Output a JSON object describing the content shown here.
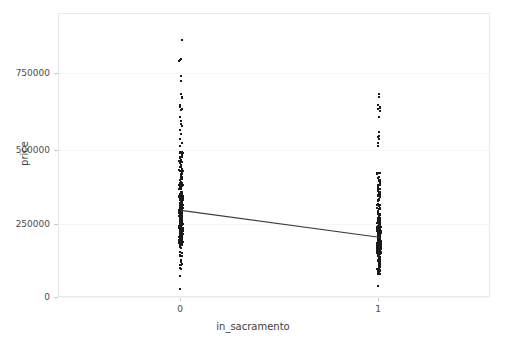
{
  "chart": {
    "title": "",
    "xlabel": "in_sacramento",
    "ylabel": "price",
    "xticks": [
      "0",
      "1"
    ],
    "yticks": [
      "0",
      "250000",
      "500000",
      "750000"
    ],
    "axis_color": "#e8e8e8",
    "point_color": "#1a1a1a",
    "line_color": "#3c3c3c"
  },
  "chart_data": {
    "type": "scatter",
    "title": "",
    "xlabel": "in_sacramento",
    "ylabel": "price",
    "xlim": [
      -0.5,
      1.5
    ],
    "ylim": [
      0,
      900000
    ],
    "xticks": [
      0,
      1
    ],
    "xtick_labels": [
      "0",
      "1"
    ],
    "yticks": [
      0,
      250000,
      500000,
      750000
    ],
    "ytick_labels": [
      "0",
      "250000",
      "500000",
      "750000"
    ],
    "grid": true,
    "legend": null,
    "categories": [
      "0",
      "1"
    ],
    "series": [
      {
        "name": "in_sacramento = 0",
        "x": 0,
        "n_points": 420,
        "min": 30000,
        "max": 884790,
        "mean": 300000,
        "median": 243000,
        "q1": 181000,
        "q3": 360000,
        "outliers": [
          884790,
          820000,
          760000,
          700000,
          690000,
          684000,
          660000,
          645000,
          620000,
          605000,
          590000,
          575000,
          560000,
          545000,
          530000,
          99000,
          76000,
          30000
        ],
        "dense_range": [
          100000,
          500000
        ]
      },
      {
        "name": "in_sacramento = 1",
        "x": 1,
        "n_points": 560,
        "min": 40000,
        "max": 700000,
        "mean": 208000,
        "median": 190000,
        "q1": 148000,
        "q3": 250000,
        "outliers": [
          700000,
          690000,
          655000,
          640000,
          620000,
          555000,
          545000,
          530000,
          40000
        ],
        "dense_range": [
          80000,
          430000
        ]
      }
    ],
    "trend_line": {
      "type": "linear-fit",
      "x": [
        0,
        1
      ],
      "y": [
        300000,
        208000
      ],
      "color": "#3c3c3c"
    }
  }
}
